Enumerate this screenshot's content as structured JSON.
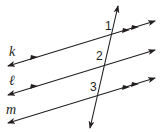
{
  "diagram": {
    "type": "parallel-lines-cut-by-transversal",
    "lines": [
      {
        "name": "k",
        "label": "k",
        "x1": 8,
        "y1": 66,
        "x2": 155,
        "y2": 21,
        "parallel_marks": 2
      },
      {
        "name": "l",
        "label": "ℓ",
        "x1": 8,
        "y1": 95,
        "x2": 155,
        "y2": 50,
        "parallel_marks": 1
      },
      {
        "name": "m",
        "label": "m",
        "x1": 8,
        "y1": 123,
        "x2": 155,
        "y2": 78,
        "parallel_marks": 2
      }
    ],
    "transversal": {
      "x1": 118,
      "y1": 6,
      "x2": 90,
      "y2": 128
    },
    "angles": [
      {
        "label": "1",
        "x": 105,
        "y": 30
      },
      {
        "label": "2",
        "x": 96,
        "y": 60
      },
      {
        "label": "3",
        "x": 90,
        "y": 91
      }
    ],
    "line_labels": [
      {
        "text": "k",
        "x": 9,
        "y": 56
      },
      {
        "text": "ℓ",
        "x": 9,
        "y": 85
      },
      {
        "text": "m",
        "x": 6,
        "y": 114
      }
    ],
    "stroke_color": "#231f20"
  }
}
